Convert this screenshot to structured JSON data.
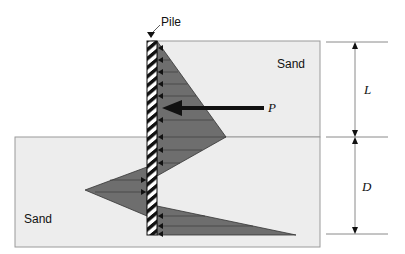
{
  "diagram": {
    "type": "sheet-pile-earth-pressure",
    "labels": {
      "pile": "Pile",
      "sand_upper": "Sand",
      "sand_lower": "Sand",
      "load": "P",
      "dim_upper": "L",
      "dim_lower": "D"
    },
    "colors": {
      "soil_fill": "#ededed",
      "soil_border": "#9a9a9a",
      "pressure_fill": "#6e6e6e",
      "pile_dark": "#111111",
      "pile_light": "#ffffff",
      "dimension_line": "#8a8a8a"
    }
  }
}
